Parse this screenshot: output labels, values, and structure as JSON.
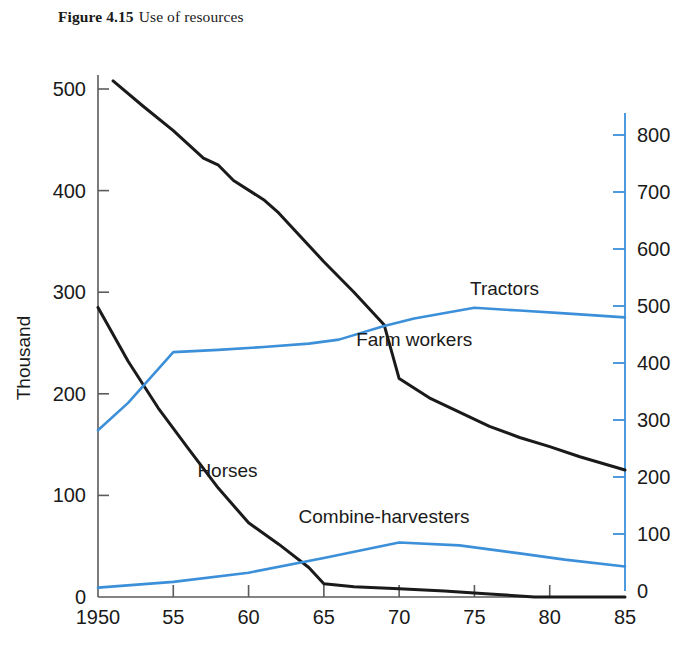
{
  "figure": {
    "number": "Figure 4.15",
    "caption": "Use of resources"
  },
  "chart_data": {
    "type": "line",
    "xlabel": "",
    "ylabel": "Thousand",
    "y2label": "",
    "xlim": [
      1950,
      1985
    ],
    "ylim": [
      0,
      530
    ],
    "y2lim": [
      0,
      830
    ],
    "grid": false,
    "legend": "inline-labels",
    "xticks": [
      1950,
      1955,
      1960,
      1965,
      1970,
      1975,
      1980,
      1985
    ],
    "xticklabels": [
      "1950",
      "55",
      "60",
      "65",
      "70",
      "75",
      "80",
      "85"
    ],
    "yticks": [
      0,
      100,
      200,
      300,
      400,
      500
    ],
    "yticklabels": [
      "0",
      "100",
      "200",
      "300",
      "400",
      "500"
    ],
    "y2ticks": [
      0,
      100,
      200,
      300,
      400,
      500,
      600,
      700,
      800
    ],
    "y2ticklabels": [
      "0",
      "100",
      "200",
      "300",
      "400",
      "500",
      "600",
      "700",
      "800"
    ],
    "colors": {
      "left_axis": "#5b5b5b",
      "right_axis": "#3c8fd9",
      "black_series": "#1a1a1a",
      "blue_series": "#3c8fd9"
    },
    "series": [
      {
        "name": "Farm workers",
        "axis": "left",
        "color": "#1a1a1a",
        "label_x": 1971.0,
        "label_y": 247,
        "x": [
          1951,
          1953,
          1955,
          1957,
          1958,
          1959,
          1961,
          1962,
          1963,
          1965,
          1967,
          1969,
          1970,
          1972,
          1974,
          1976,
          1978,
          1980,
          1982,
          1985
        ],
        "values": [
          508,
          483,
          459,
          432,
          425,
          410,
          391,
          378,
          362,
          330,
          300,
          268,
          215,
          196,
          182,
          168,
          157,
          148,
          138,
          125
        ]
      },
      {
        "name": "Horses",
        "axis": "left",
        "color": "#1a1a1a",
        "label_x": 1958.6,
        "label_y": 118,
        "x": [
          1950,
          1952,
          1954,
          1956,
          1958,
          1960,
          1962,
          1964,
          1965,
          1967,
          1970,
          1973,
          1976,
          1979,
          1985
        ],
        "values": [
          285,
          232,
          186,
          146,
          107,
          73,
          52,
          29,
          13,
          10,
          8,
          6,
          3,
          0,
          0
        ]
      },
      {
        "name": "Tractors",
        "axis": "right",
        "color": "#3c8fd9",
        "label_x": 1977.0,
        "label_y": 520,
        "x": [
          1950,
          1952,
          1955,
          1958,
          1961,
          1964,
          1966,
          1969,
          1971,
          1975,
          1978,
          1981,
          1985
        ],
        "values": [
          282,
          330,
          419,
          423,
          428,
          434,
          441,
          465,
          478,
          497,
          492,
          487,
          480
        ]
      },
      {
        "name": "Combine-harvesters",
        "axis": "right",
        "color": "#3c8fd9",
        "label_x": 1969.0,
        "label_y": 120,
        "x": [
          1950,
          1955,
          1960,
          1965,
          1970,
          1974,
          1978,
          1981,
          1985
        ],
        "values": [
          6,
          16,
          32,
          58,
          85,
          80,
          66,
          55,
          43
        ]
      }
    ]
  },
  "axis_titles": {
    "left": "Thousand"
  },
  "series_labels": {
    "tractors": "Tractors",
    "farm_workers": "Farm workers",
    "horses": "Horses",
    "combine_harvesters": "Combine-harvesters"
  }
}
